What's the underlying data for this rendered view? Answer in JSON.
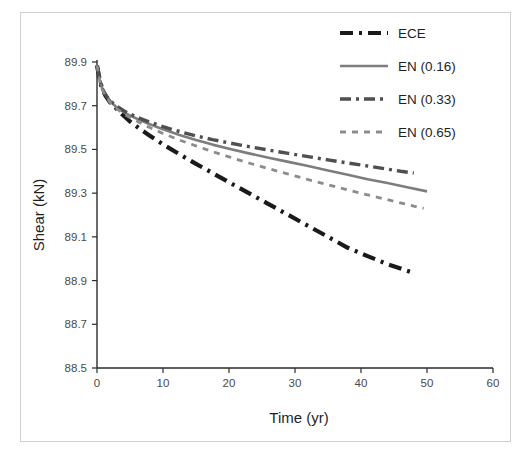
{
  "figure": {
    "background": "#ffffff",
    "border_color": "#cfcfcf"
  },
  "chart_data": {
    "type": "line",
    "title": "",
    "xlabel": "Time (yr)",
    "ylabel": "Shear (kN)",
    "xlim": [
      0,
      60
    ],
    "ylim": [
      88.5,
      89.9
    ],
    "xticks": [
      0,
      10,
      20,
      30,
      40,
      50,
      60
    ],
    "xtick_labels": [
      "0",
      "10",
      "20",
      "30",
      "40",
      "50",
      "60"
    ],
    "yticks": [
      88.5,
      88.7,
      88.9,
      89.1,
      89.3,
      89.5,
      89.7,
      89.9
    ],
    "ytick_labels": [
      "88.5",
      "88.7",
      "88.9",
      "89.1",
      "89.3",
      "89.5",
      "89.7",
      "89.9"
    ],
    "grid": false,
    "legend_position": "top-right",
    "series": [
      {
        "name": "ECE",
        "color": "#1a1a1a",
        "width": 4.2,
        "dash": "13,6,3,6",
        "x": [
          0,
          0.4,
          0.8,
          1.3,
          2,
          3,
          4,
          5,
          6.5,
          8,
          10,
          12.5,
          15,
          17.5,
          20,
          23,
          26,
          29,
          32,
          35,
          38,
          41,
          44,
          46,
          48
        ],
        "y": [
          89.885,
          89.82,
          89.775,
          89.745,
          89.715,
          89.685,
          89.655,
          89.628,
          89.594,
          89.563,
          89.523,
          89.478,
          89.434,
          89.392,
          89.35,
          89.3,
          89.25,
          89.2,
          89.15,
          89.1,
          89.05,
          89.012,
          88.975,
          88.955,
          88.935
        ]
      },
      {
        "name": "EN (0.16)",
        "color": "#7d7d7d",
        "width": 2.6,
        "dash": "none",
        "x": [
          0,
          0.4,
          0.8,
          1.3,
          2,
          3,
          4,
          5,
          6.5,
          8,
          10,
          12.5,
          15,
          17.5,
          20,
          23,
          26,
          29,
          32,
          35,
          38,
          41,
          44,
          47,
          50
        ],
        "y": [
          89.885,
          89.82,
          89.778,
          89.75,
          89.72,
          89.692,
          89.672,
          89.655,
          89.634,
          89.615,
          89.592,
          89.566,
          89.543,
          89.522,
          89.503,
          89.482,
          89.462,
          89.443,
          89.424,
          89.404,
          89.384,
          89.364,
          89.346,
          89.327,
          89.308
        ]
      },
      {
        "name": "EN (0.33)",
        "color": "#4f4f4f",
        "width": 3.4,
        "dash": "11,5,3,5",
        "x": [
          0,
          0.4,
          0.8,
          1.3,
          2,
          3,
          4,
          5,
          6.5,
          8,
          10,
          12.5,
          15,
          17.5,
          20,
          23,
          26,
          29,
          32,
          35,
          38,
          41,
          44,
          46,
          48
        ],
        "y": [
          89.885,
          89.82,
          89.778,
          89.75,
          89.722,
          89.697,
          89.678,
          89.662,
          89.642,
          89.625,
          89.604,
          89.582,
          89.562,
          89.545,
          89.53,
          89.513,
          89.497,
          89.482,
          89.467,
          89.452,
          89.438,
          89.424,
          89.41,
          89.4,
          89.392
        ]
      },
      {
        "name": "EN (0.65)",
        "color": "#8c8c8c",
        "width": 2.8,
        "dash": "6,6",
        "x": [
          0,
          0.4,
          0.8,
          1.3,
          2,
          3,
          4,
          5,
          6.5,
          8,
          10,
          12.5,
          15,
          17.5,
          20,
          23,
          26,
          29,
          32,
          35,
          38,
          41,
          44,
          47,
          49.5
        ],
        "y": [
          89.885,
          89.818,
          89.774,
          89.745,
          89.714,
          89.686,
          89.664,
          89.646,
          89.622,
          89.6,
          89.573,
          89.543,
          89.516,
          89.49,
          89.466,
          89.438,
          89.412,
          89.387,
          89.362,
          89.338,
          89.315,
          89.292,
          89.27,
          89.248,
          89.23
        ]
      }
    ]
  },
  "legend": {
    "entries": [
      {
        "label": "ECE"
      },
      {
        "label": "EN (0.16)"
      },
      {
        "label": "EN (0.33)"
      },
      {
        "label": "EN (0.65)"
      }
    ]
  }
}
